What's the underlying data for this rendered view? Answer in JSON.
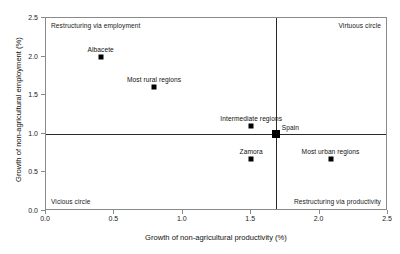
{
  "chart_data": {
    "type": "scatter",
    "title": "",
    "xlabel": "Growth of non-agricultural productivity (%)",
    "ylabel": "Growth of non-agricultural employment (%)",
    "xlim": [
      0.0,
      2.5
    ],
    "ylim": [
      0.0,
      2.5
    ],
    "xticks": [
      "0.0",
      "0.5",
      "1.0",
      "1.5",
      "2.0",
      "2.5"
    ],
    "xtick_values": [
      0.0,
      0.5,
      1.0,
      1.5,
      2.0,
      2.5
    ],
    "yticks": [
      "0.0",
      "0.5",
      "1.0",
      "1.5",
      "2.0",
      "2.5"
    ],
    "ytick_values": [
      0.0,
      0.5,
      1.0,
      1.5,
      2.0,
      2.5
    ],
    "grid": false,
    "legend": "none",
    "reference_lines": {
      "horizontal_y": 1.0,
      "vertical_x": 1.68
    },
    "points": [
      {
        "label": "Albacete",
        "x": 0.4,
        "y": 2.0,
        "size": "small",
        "label_pos": "above"
      },
      {
        "label": "Most rural regions",
        "x": 0.79,
        "y": 1.6,
        "size": "small",
        "label_pos": "above"
      },
      {
        "label": "Intermediate regions",
        "x": 1.5,
        "y": 1.1,
        "size": "small",
        "label_pos": "above"
      },
      {
        "label": "Spain",
        "x": 1.68,
        "y": 1.0,
        "size": "large",
        "label_pos": "right"
      },
      {
        "label": "Zamora",
        "x": 1.5,
        "y": 0.67,
        "size": "small",
        "label_pos": "above"
      },
      {
        "label": "Most urban regions",
        "x": 2.08,
        "y": 0.67,
        "size": "small",
        "label_pos": "above"
      }
    ],
    "quadrant_labels": {
      "top_left": "Restructuring via employment",
      "top_right": "Virtuous circle",
      "bottom_left": "Vicious circle",
      "bottom_right": "Restructuring via productivity"
    }
  },
  "colors": {
    "marker": "#000000",
    "frame": "#8a8a8a",
    "reference_line": "#2a2a2a",
    "text": "#111111",
    "background": "#ffffff"
  }
}
